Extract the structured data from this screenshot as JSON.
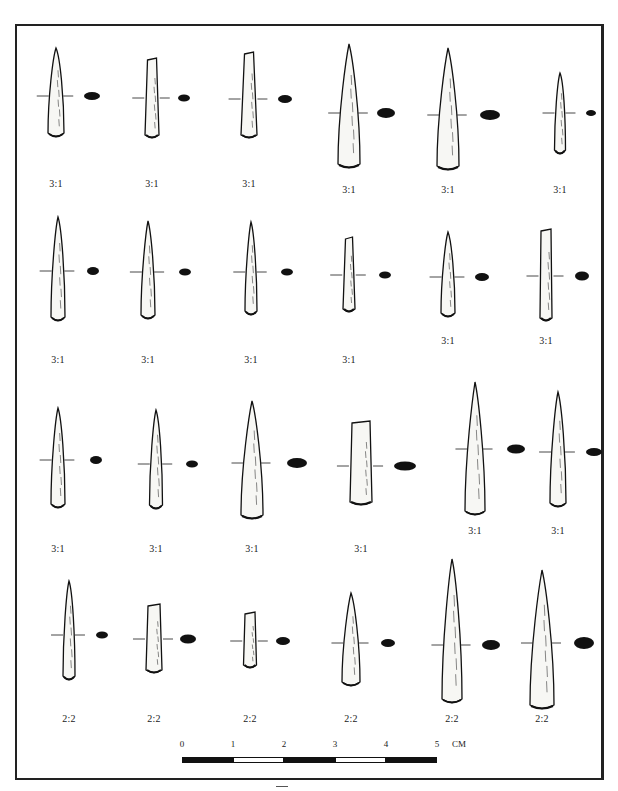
{
  "figure": {
    "type": "archaeological-plate",
    "frame_color": "#222222",
    "ink_color": "#111111"
  },
  "rows": [
    {
      "items": [
        {
          "cx": 56,
          "top": 48,
          "bottom": 137,
          "wTop": 4,
          "wBot": 16,
          "tip": "point",
          "secY": 96,
          "secRx": 8,
          "secRy": 4,
          "secX": 92,
          "label": "3:1",
          "labelY": 186
        },
        {
          "cx": 152,
          "top": 58,
          "bottom": 138,
          "wTop": 9,
          "wBot": 14,
          "tip": "flat",
          "secY": 98,
          "secRx": 6,
          "secRy": 3.5,
          "secX": 184,
          "label": "3:1",
          "labelY": 186
        },
        {
          "cx": 249,
          "top": 52,
          "bottom": 138,
          "wTop": 9,
          "wBot": 16,
          "tip": "flat",
          "secY": 99,
          "secRx": 7,
          "secRy": 4,
          "secX": 285,
          "label": "3:1",
          "labelY": 186
        },
        {
          "cx": 349,
          "top": 44,
          "bottom": 168,
          "wTop": 3,
          "wBot": 22,
          "tip": "point",
          "secY": 113,
          "secRx": 9,
          "secRy": 5,
          "secX": 386,
          "label": "3:1",
          "labelY": 192
        },
        {
          "cx": 448,
          "top": 48,
          "bottom": 170,
          "wTop": 3,
          "wBot": 22,
          "tip": "point",
          "secY": 115,
          "secRx": 10,
          "secRy": 5,
          "secX": 490,
          "label": "3:1",
          "labelY": 192
        },
        {
          "cx": 560,
          "top": 73,
          "bottom": 154,
          "wTop": 3,
          "wBot": 11,
          "tip": "point",
          "secY": 113,
          "secRx": 5,
          "secRy": 3,
          "secX": 591,
          "label": "3:1",
          "labelY": 192
        }
      ]
    },
    {
      "items": [
        {
          "cx": 58,
          "top": 217,
          "bottom": 321,
          "wTop": 3,
          "wBot": 14,
          "tip": "point",
          "secY": 271,
          "secRx": 6,
          "secRy": 4,
          "secX": 93,
          "label": "3:1",
          "labelY": 362
        },
        {
          "cx": 148,
          "top": 221,
          "bottom": 319,
          "wTop": 2,
          "wBot": 14,
          "tip": "point",
          "secY": 272,
          "secRx": 6,
          "secRy": 3.5,
          "secX": 185,
          "label": "3:1",
          "labelY": 362
        },
        {
          "cx": 251,
          "top": 222,
          "bottom": 315,
          "wTop": 2,
          "wBot": 12,
          "tip": "point",
          "secY": 272,
          "secRx": 6,
          "secRy": 3.5,
          "secX": 287,
          "label": "3:1",
          "labelY": 362
        },
        {
          "cx": 349,
          "top": 237,
          "bottom": 312,
          "wTop": 7,
          "wBot": 12,
          "tip": "flat",
          "secY": 275,
          "secRx": 6,
          "secRy": 3.5,
          "secX": 385,
          "label": "3:1",
          "labelY": 362
        },
        {
          "cx": 448,
          "top": 232,
          "bottom": 317,
          "wTop": 3,
          "wBot": 14,
          "tip": "point",
          "secY": 277,
          "secRx": 7,
          "secRy": 4,
          "secX": 482,
          "label": "3:1",
          "labelY": 343
        },
        {
          "cx": 546,
          "top": 229,
          "bottom": 321,
          "wTop": 10,
          "wBot": 12,
          "tip": "flat",
          "secY": 276,
          "secRx": 7,
          "secRy": 4.5,
          "secX": 582,
          "label": "3:1",
          "labelY": 343
        }
      ]
    },
    {
      "items": [
        {
          "cx": 58,
          "top": 408,
          "bottom": 508,
          "wTop": 3,
          "wBot": 14,
          "tip": "point",
          "secY": 460,
          "secRx": 6,
          "secRy": 4,
          "secX": 96,
          "label": "3:1",
          "labelY": 551
        },
        {
          "cx": 156,
          "top": 410,
          "bottom": 509,
          "wTop": 3,
          "wBot": 13,
          "tip": "point",
          "secY": 464,
          "secRx": 6,
          "secRy": 3.5,
          "secX": 192,
          "label": "3:1",
          "labelY": 551
        },
        {
          "cx": 252,
          "top": 401,
          "bottom": 519,
          "wTop": 3,
          "wBot": 22,
          "tip": "point",
          "secY": 463,
          "secRx": 10,
          "secRy": 5,
          "secX": 297,
          "label": "3:1",
          "labelY": 551
        },
        {
          "cx": 361,
          "top": 421,
          "bottom": 505,
          "wTop": 18,
          "wBot": 22,
          "tip": "flat",
          "secY": 466,
          "secRx": 11,
          "secRy": 4.5,
          "secX": 405,
          "label": "3:1",
          "labelY": 551
        },
        {
          "cx": 475,
          "top": 382,
          "bottom": 515,
          "wTop": 2,
          "wBot": 20,
          "tip": "point",
          "secY": 449,
          "secRx": 9,
          "secRy": 4.5,
          "secX": 516,
          "label": "3:1",
          "labelY": 533
        },
        {
          "cx": 558,
          "top": 392,
          "bottom": 507,
          "wTop": 3,
          "wBot": 16,
          "tip": "point",
          "secY": 452,
          "secRx": 8,
          "secRy": 4,
          "secX": 594,
          "label": "3:1",
          "labelY": 533
        }
      ]
    },
    {
      "items": [
        {
          "cx": 69,
          "top": 581,
          "bottom": 680,
          "wTop": 3,
          "wBot": 12,
          "tip": "point",
          "secY": 635,
          "secRx": 6,
          "secRy": 3.5,
          "secX": 102,
          "label": "2:2",
          "labelY": 721
        },
        {
          "cx": 154,
          "top": 604,
          "bottom": 673,
          "wTop": 12,
          "wBot": 16,
          "tip": "flat",
          "secY": 639,
          "secRx": 8,
          "secRy": 4.5,
          "secX": 188,
          "label": "2:2",
          "labelY": 721
        },
        {
          "cx": 250,
          "top": 612,
          "bottom": 668,
          "wTop": 10,
          "wBot": 13,
          "tip": "flat",
          "secY": 641,
          "secRx": 7,
          "secRy": 4,
          "secX": 283,
          "label": "2:2",
          "labelY": 721
        },
        {
          "cx": 351,
          "top": 593,
          "bottom": 686,
          "wTop": 3,
          "wBot": 18,
          "tip": "point",
          "secY": 643,
          "secRx": 7,
          "secRy": 4,
          "secX": 388,
          "label": "2:2",
          "labelY": 721
        },
        {
          "cx": 452,
          "top": 559,
          "bottom": 703,
          "wTop": 3,
          "wBot": 20,
          "tip": "point",
          "secY": 645,
          "secRx": 9,
          "secRy": 5,
          "secX": 491,
          "label": "2:2",
          "labelY": 721
        },
        {
          "cx": 542,
          "top": 570,
          "bottom": 709,
          "wTop": 3,
          "wBot": 24,
          "tip": "point",
          "secY": 643,
          "secRx": 10,
          "secRy": 6,
          "secX": 584,
          "label": "2:2",
          "labelY": 721
        }
      ]
    }
  ],
  "scale_bar": {
    "ticks": [
      "0",
      "1",
      "2",
      "3",
      "4",
      "5"
    ],
    "unit": "CM",
    "segment_width_px": 51,
    "pattern": [
      "dark",
      "light",
      "dark",
      "light",
      "dark"
    ]
  }
}
